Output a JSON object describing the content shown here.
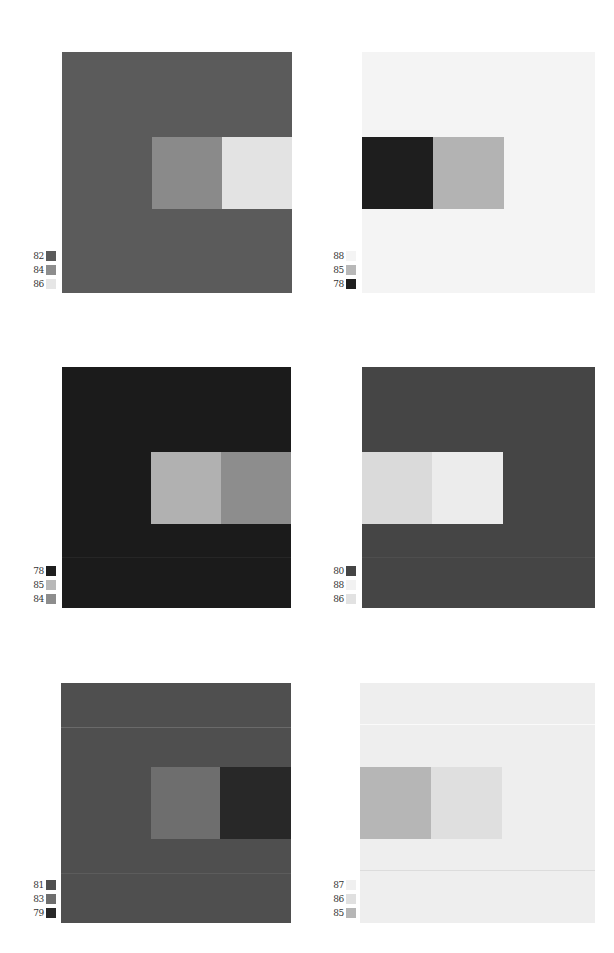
{
  "plates": [
    {
      "id": "p1",
      "ground": "#5b5b5b",
      "rect": {
        "x": 62,
        "y": 52,
        "w": 230,
        "h": 241
      },
      "inner": [
        {
          "x": 152,
          "y": 137,
          "w": 70,
          "h": 72,
          "color": "#8a8a8a"
        },
        {
          "x": 222,
          "y": 137,
          "w": 70,
          "h": 72,
          "color": "#e3e3e3"
        }
      ],
      "lines": [],
      "legend": {
        "x": 16,
        "y": 251,
        "items": [
          {
            "num": "82",
            "color": "#5b5b5b"
          },
          {
            "num": "84",
            "color": "#8d8d8d"
          },
          {
            "num": "86",
            "color": "#e6e6e6"
          }
        ]
      }
    },
    {
      "id": "p2",
      "ground": "#f4f4f4",
      "rect": {
        "x": 362,
        "y": 52,
        "w": 233,
        "h": 241
      },
      "inner": [
        {
          "x": 362,
          "y": 137,
          "w": 71,
          "h": 72,
          "color": "#1e1e1e"
        },
        {
          "x": 433,
          "y": 137,
          "w": 71,
          "h": 72,
          "color": "#b3b3b3"
        }
      ],
      "lines": [],
      "legend": {
        "x": 316,
        "y": 251,
        "items": [
          {
            "num": "88",
            "color": "#f4f4f4"
          },
          {
            "num": "85",
            "color": "#b8b8b8"
          },
          {
            "num": "78",
            "color": "#1e1e1e"
          }
        ]
      }
    },
    {
      "id": "p3",
      "ground": "#1b1b1b",
      "rect": {
        "x": 62,
        "y": 367,
        "w": 229,
        "h": 241
      },
      "inner": [
        {
          "x": 151,
          "y": 452,
          "w": 70,
          "h": 72,
          "color": "#b1b1b1"
        },
        {
          "x": 221,
          "y": 452,
          "w": 70,
          "h": 72,
          "color": "#8d8d8d"
        }
      ],
      "lines": [
        {
          "y": 557,
          "color": "#262626"
        }
      ],
      "legend": {
        "x": 16,
        "y": 566,
        "items": [
          {
            "num": "78",
            "color": "#1e1e1e"
          },
          {
            "num": "85",
            "color": "#b8b8b8"
          },
          {
            "num": "84",
            "color": "#8d8d8d"
          }
        ]
      }
    },
    {
      "id": "p4",
      "ground": "#454545",
      "rect": {
        "x": 362,
        "y": 367,
        "w": 233,
        "h": 241
      },
      "inner": [
        {
          "x": 362,
          "y": 452,
          "w": 70,
          "h": 72,
          "color": "#dadada"
        },
        {
          "x": 432,
          "y": 452,
          "w": 71,
          "h": 72,
          "color": "#ececec"
        }
      ],
      "lines": [
        {
          "y": 557,
          "color": "#4e4e4e"
        }
      ],
      "legend": {
        "x": 316,
        "y": 566,
        "items": [
          {
            "num": "80",
            "color": "#454545"
          },
          {
            "num": "88",
            "color": "#f2f2f2"
          },
          {
            "num": "86",
            "color": "#e2e2e2"
          }
        ]
      }
    },
    {
      "id": "p5",
      "ground": "#4f4f4f",
      "rect": {
        "x": 61,
        "y": 683,
        "w": 230,
        "h": 240
      },
      "inner": [
        {
          "x": 151,
          "y": 767,
          "w": 69,
          "h": 72,
          "color": "#6e6e6e"
        },
        {
          "x": 220,
          "y": 767,
          "w": 71,
          "h": 72,
          "color": "#282828"
        }
      ],
      "lines": [
        {
          "y": 727,
          "color": "#6a6a6a"
        },
        {
          "y": 873,
          "color": "#5c5c5c"
        }
      ],
      "legend": {
        "x": 16,
        "y": 880,
        "items": [
          {
            "num": "81",
            "color": "#4f4f4f"
          },
          {
            "num": "83",
            "color": "#6e6e6e"
          },
          {
            "num": "79",
            "color": "#282828"
          }
        ]
      }
    },
    {
      "id": "p6",
      "ground": "#eeeeee",
      "rect": {
        "x": 360,
        "y": 683,
        "w": 235,
        "h": 240
      },
      "inner": [
        {
          "x": 360,
          "y": 767,
          "w": 71,
          "h": 72,
          "color": "#b6b6b6"
        },
        {
          "x": 431,
          "y": 767,
          "w": 71,
          "h": 72,
          "color": "#dfdfdf"
        }
      ],
      "lines": [
        {
          "y": 724,
          "color": "#fafafa"
        },
        {
          "y": 870,
          "color": "#dcdcdc"
        }
      ],
      "legend": {
        "x": 316,
        "y": 880,
        "items": [
          {
            "num": "87",
            "color": "#f0f0f0"
          },
          {
            "num": "86",
            "color": "#e0e0e0"
          },
          {
            "num": "85",
            "color": "#b6b6b6"
          }
        ]
      }
    }
  ]
}
